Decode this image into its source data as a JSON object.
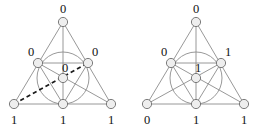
{
  "figure": {
    "panel_count": 2,
    "colors": {
      "background": "#ffffff",
      "edge": "#8c8c8c",
      "dashed_edge": "#1a1a1a",
      "node_fill": "#eeeeee",
      "node_stroke": "#6e6e6e",
      "label_text": "#111111"
    }
  },
  "panels": [
    {
      "id": "left",
      "name": "left-fano-diagram",
      "has_dashed_line": true,
      "dashed_line": {
        "from": "bottom-left",
        "through": "center",
        "to": "mid-right"
      },
      "labels": {
        "top": "0",
        "mid_left": "0",
        "mid_right": "0",
        "center": "0",
        "bottom_left": "1",
        "bottom_mid": "1",
        "bottom_right": "1"
      }
    },
    {
      "id": "right",
      "name": "right-fano-diagram",
      "has_dashed_line": false,
      "labels": {
        "top": "0",
        "mid_left": "0",
        "mid_right": "1",
        "center": "1",
        "bottom_left": "0",
        "bottom_mid": "1",
        "bottom_right": "1"
      }
    }
  ]
}
